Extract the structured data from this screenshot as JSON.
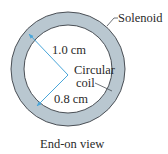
{
  "diagram": {
    "solenoid_label": "Solenoid",
    "coil_label_line1": "Circular",
    "coil_label_line2": "coil",
    "outer_radius_label": "1.0 cm",
    "inner_radius_label": "0.8 cm",
    "caption": "End-on view",
    "colors": {
      "ring_fill": "#b9c7d0",
      "ring_stroke": "#4a4f55",
      "arrow": "#4aa6d9",
      "text": "#2a2a2a",
      "background": "#ffffff"
    },
    "geometry": {
      "center": [
        68,
        69
      ],
      "outer_radius": 57,
      "inner_radius": 44
    }
  }
}
